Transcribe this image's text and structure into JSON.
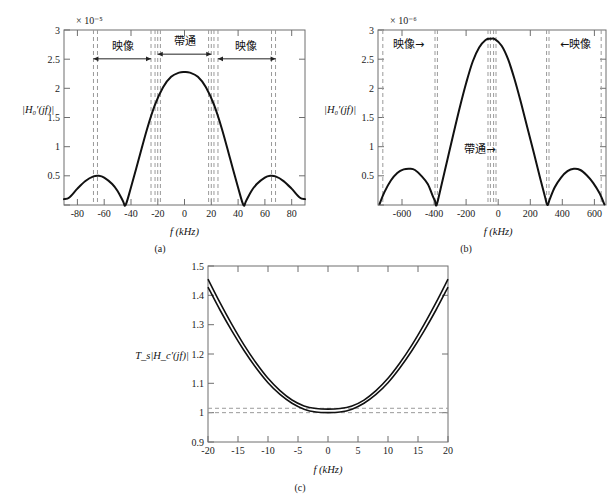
{
  "figure": {
    "panels": [
      {
        "caption": "(a)",
        "ylabel": "|H₀′(jf)|",
        "xlabel": "f (kHz)",
        "exponent": "× 10⁻⁵",
        "annotations": [
          "映像",
          "帶通",
          "映像"
        ]
      },
      {
        "caption": "(b)",
        "ylabel": "|H₀′(jf)|",
        "xlabel": "f (kHz)",
        "exponent": "× 10⁻⁶",
        "annotations": [
          "映像→",
          "帶通→",
          "←映像"
        ]
      },
      {
        "caption": "(c)",
        "ylabel": "T_s|H_c′(jf)|",
        "xlabel": "f (kHz)",
        "exponent": "",
        "annotations": []
      }
    ]
  },
  "chart_data": [
    {
      "type": "line",
      "panel": "(a)",
      "title": "",
      "xlabel": "f (kHz)",
      "ylabel": "|H0'(jf)|",
      "yscale_exponent": "x 10^-5",
      "xlim": [
        -90,
        90
      ],
      "ylim": [
        0,
        3
      ],
      "xticks": [
        -80,
        -60,
        -40,
        -20,
        0,
        20,
        40,
        60,
        80
      ],
      "yticks": [
        0,
        0.5,
        1,
        1.5,
        2,
        2.5,
        3
      ],
      "grid": false,
      "legend": "none",
      "series": [
        {
          "name": "|H0'(jf)| magnitude",
          "description": "sinc-like magnitude response, main lobe centered at f=0 peaking at 2.28e-5, nulls at +/-44 kHz, side lobes peaking at 0.50e-5 near +/-64 kHz",
          "x": [
            -90,
            -86,
            -80,
            -74,
            -68,
            -64,
            -60,
            -54,
            -50,
            -46,
            -44,
            -40,
            -34,
            -28,
            -22,
            -16,
            -10,
            -4,
            0,
            4,
            10,
            16,
            22,
            28,
            34,
            40,
            44,
            46,
            50,
            54,
            60,
            64,
            68,
            74,
            80,
            86,
            90
          ],
          "y": [
            0.1,
            0.13,
            0.28,
            0.41,
            0.49,
            0.5,
            0.47,
            0.36,
            0.24,
            0.07,
            0.0,
            0.3,
            0.8,
            1.3,
            1.72,
            2.02,
            2.2,
            2.27,
            2.28,
            2.27,
            2.2,
            2.02,
            1.72,
            1.3,
            0.8,
            0.3,
            0.0,
            0.07,
            0.24,
            0.36,
            0.47,
            0.5,
            0.49,
            0.41,
            0.28,
            0.13,
            0.1
          ]
        }
      ],
      "dashed_vlines": [
        -68,
        -65,
        -25,
        -22,
        -20,
        -18,
        18,
        20,
        22,
        25,
        65,
        68
      ],
      "annotations": [
        {
          "text": "映像",
          "x": -46,
          "y": 2.66,
          "arrow_from": -68,
          "arrow_to": -25
        },
        {
          "text": "帶通",
          "x": 0,
          "y": 2.74,
          "arrow_from": -20,
          "arrow_to": 20
        },
        {
          "text": "映像",
          "x": 46,
          "y": 2.66,
          "arrow_from": 25,
          "arrow_to": 68
        }
      ]
    },
    {
      "type": "line",
      "panel": "(b)",
      "title": "",
      "xlabel": "f (kHz)",
      "ylabel": "|H0'(jf)|",
      "yscale_exponent": "x 10^-6",
      "xlim": [
        -710,
        710
      ],
      "ylim": [
        0,
        3
      ],
      "xticks": [
        -600,
        -400,
        -200,
        0,
        200,
        400,
        600
      ],
      "yticks": [
        0,
        0.5,
        1,
        1.5,
        2,
        2.5,
        3
      ],
      "grid": false,
      "legend": "none",
      "series": [
        {
          "name": "|H0'(jf)| magnitude",
          "description": "sinc-like magnitude response, main lobe peaking at 2.85e-6 near f=0, nulls at +/-345 kHz, side lobes peaking at 0.62e-6 near +/-500 kHz",
          "x": [
            -700,
            -670,
            -630,
            -590,
            -550,
            -510,
            -480,
            -440,
            -400,
            -370,
            -355,
            -345,
            -320,
            -280,
            -240,
            -200,
            -160,
            -120,
            -80,
            -40,
            -10,
            20,
            60,
            100,
            140,
            180,
            220,
            260,
            300,
            330,
            345,
            360,
            390,
            430,
            470,
            510,
            550,
            590,
            630,
            670,
            700
          ],
          "y": [
            0.02,
            0.22,
            0.42,
            0.55,
            0.61,
            0.62,
            0.6,
            0.5,
            0.36,
            0.16,
            0.07,
            0.0,
            0.28,
            0.75,
            1.22,
            1.68,
            2.1,
            2.46,
            2.7,
            2.83,
            2.85,
            2.84,
            2.73,
            2.5,
            2.16,
            1.76,
            1.33,
            0.9,
            0.46,
            0.14,
            0.0,
            0.1,
            0.3,
            0.47,
            0.58,
            0.62,
            0.6,
            0.51,
            0.38,
            0.2,
            0.01
          ]
        }
      ],
      "dashed_vlines": [
        -680,
        -355,
        -340,
        -25,
        -10,
        10,
        25,
        340,
        355,
        680
      ],
      "annotations": [
        {
          "text": "映像→",
          "x": -520,
          "y": 2.7,
          "arrow_from": -680,
          "arrow_to": -355
        },
        {
          "text": "帶通→",
          "x": -75,
          "y": 0.9,
          "arrow_from": -200,
          "arrow_to": -10
        },
        {
          "text": "←映像",
          "x": 520,
          "y": 2.7,
          "arrow_from": 680,
          "arrow_to": 355
        }
      ]
    },
    {
      "type": "line",
      "panel": "(c)",
      "title": "",
      "xlabel": "f (kHz)",
      "ylabel": "Ts|Hc'(jf)|",
      "yscale_exponent": "",
      "xlim": [
        -20,
        20
      ],
      "ylim": [
        0.9,
        1.5
      ],
      "xticks": [
        -20,
        -15,
        -10,
        -5,
        0,
        5,
        10,
        15,
        20
      ],
      "yticks": [
        0.9,
        1,
        1.1,
        1.2,
        1.3,
        1.4,
        1.5
      ],
      "grid": false,
      "legend": "none",
      "series": [
        {
          "name": "upper compensator response",
          "x": [
            -20,
            -18,
            -16,
            -14,
            -12,
            -10,
            -8,
            -6,
            -4,
            -2,
            0,
            2,
            4,
            6,
            8,
            10,
            12,
            14,
            16,
            18,
            20
          ],
          "y": [
            1.455,
            1.375,
            1.3,
            1.231,
            1.17,
            1.117,
            1.075,
            1.043,
            1.023,
            1.014,
            1.012,
            1.014,
            1.023,
            1.043,
            1.075,
            1.117,
            1.17,
            1.231,
            1.3,
            1.375,
            1.455
          ]
        },
        {
          "name": "lower compensator response",
          "x": [
            -20,
            -18,
            -16,
            -14,
            -12,
            -10,
            -8,
            -6,
            -4,
            -2,
            0,
            2,
            4,
            6,
            8,
            10,
            12,
            14,
            16,
            18,
            20
          ],
          "y": [
            1.428,
            1.35,
            1.278,
            1.212,
            1.153,
            1.102,
            1.062,
            1.032,
            1.012,
            1.002,
            1.0,
            1.002,
            1.012,
            1.032,
            1.062,
            1.102,
            1.153,
            1.212,
            1.278,
            1.35,
            1.428
          ]
        }
      ],
      "dashed_hlines": [
        1.0,
        1.015
      ],
      "annotations": []
    }
  ],
  "colors": {
    "curve": "#111111",
    "axis": "#6e6e6e",
    "dashed": "#9a9a9a",
    "background": "#ffffff"
  }
}
